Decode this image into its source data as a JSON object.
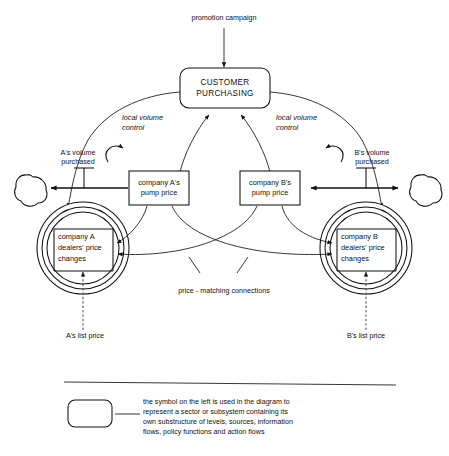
{
  "diagram": {
    "title_text": "promotion campaign",
    "sector": {
      "line1": "CUSTOMER",
      "line2": "PURCHASING"
    },
    "left": {
      "pump_price_line1": "company A's",
      "pump_price_line2": "pump price",
      "volume_line1": "A's volume",
      "volume_line2": "purchased",
      "loop_label_line1": "local volume",
      "loop_label_line2": "control",
      "dealers_line1": "company A",
      "dealers_line2": "dealers' price",
      "dealers_line3": "changes",
      "list_price": "A's list price"
    },
    "right": {
      "pump_price_line1": "company B's",
      "pump_price_line2": "pump price",
      "volume_line1": "B's volume",
      "volume_line2": "purchased",
      "loop_label_line1": "local volume",
      "loop_label_line2": "control",
      "dealers_line1": "company B",
      "dealers_line2": "dealers' price",
      "dealers_line3": "changes",
      "list_price": "B's list price"
    },
    "center_annotation": "price - matching connections",
    "legend": {
      "line1": "the symbol  on the left is used  in the diagram to",
      "line2": "represent a sector or subsystem containing its",
      "line3": "own substructure of levels, sources, information",
      "line4": "flows, policy functions and action flows"
    },
    "colors": {
      "ink": "#111111",
      "paper": "#ffffff",
      "dashed": "#333333"
    }
  }
}
